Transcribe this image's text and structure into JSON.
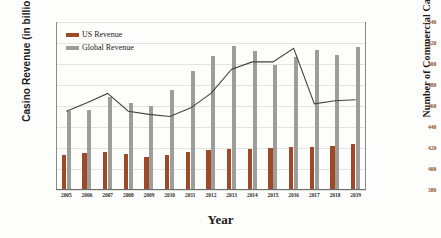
{
  "chart_data": {
    "type": "bar",
    "title": "",
    "xlabel": "Year",
    "ylabel": "Casino Revenue (in billions)",
    "ylabel_secondary": "Number of Commercial Casinos",
    "categories": [
      "2005",
      "2006",
      "2007",
      "2008",
      "2009",
      "2010",
      "2011",
      "2012",
      "2013",
      "2014",
      "2015",
      "2016",
      "2017",
      "2018",
      "2019"
    ],
    "ylim": [
      0,
      160
    ],
    "ylim_secondary": [
      380,
      540
    ],
    "yticks": [
      0,
      20,
      40,
      60,
      80,
      100,
      120,
      140,
      160
    ],
    "yticks_secondary": [
      380,
      400,
      420,
      440,
      460,
      480,
      500,
      520,
      540
    ],
    "grid": true,
    "legend_position": "upper-left",
    "series": [
      {
        "name": "US Revenue",
        "type": "bar",
        "axis": "left",
        "color": "#9d4a29",
        "values": [
          33,
          35,
          36,
          34,
          31,
          33,
          36,
          38,
          39,
          39,
          40,
          41,
          41,
          42,
          44
        ]
      },
      {
        "name": "Global Revenue",
        "type": "bar",
        "axis": "left",
        "color": "#9d9d9b",
        "values": [
          75,
          76,
          89,
          83,
          80,
          95,
          113,
          128,
          137,
          132,
          119,
          127,
          133,
          129,
          136
        ]
      },
      {
        "name": "Number of Commercial Casinos",
        "type": "line",
        "axis": "right",
        "color": "#4a4038",
        "values": [
          455,
          463,
          472,
          455,
          452,
          450,
          458,
          472,
          495,
          502,
          502,
          515,
          462,
          465,
          466
        ]
      }
    ]
  },
  "legend": {
    "items": [
      {
        "label": "US Revenue",
        "color": "#9d4a29"
      },
      {
        "label": "Global Revenue",
        "color": "#9d9d9b"
      }
    ]
  }
}
